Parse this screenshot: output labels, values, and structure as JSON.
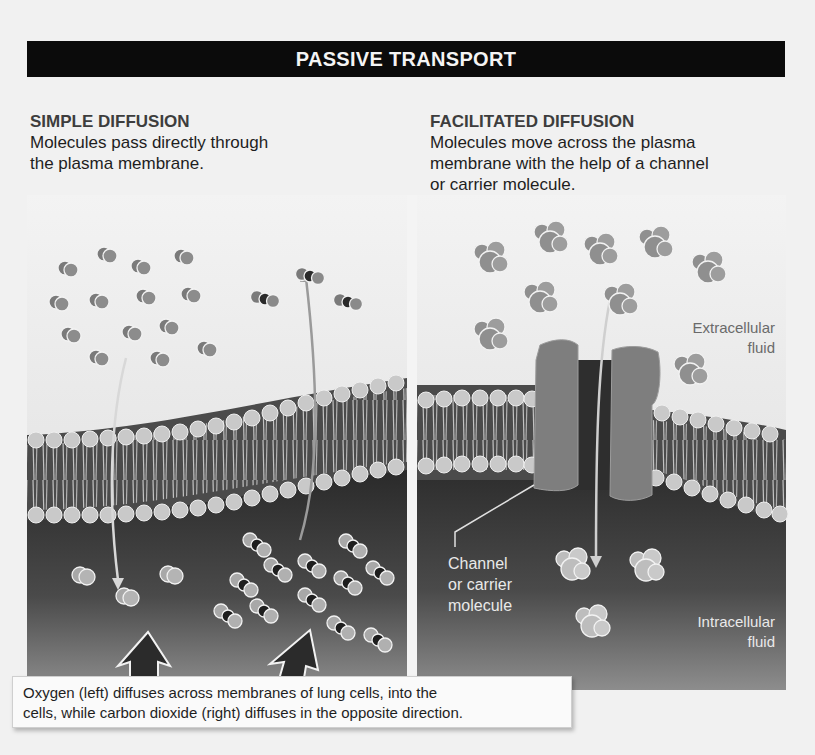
{
  "title": "PASSIVE TRANSPORT",
  "panels": {
    "simple": {
      "heading": "SIMPLE DIFFUSION",
      "description": "Molecules pass directly through the plasma membrane.",
      "description_lines": [
        "Molecules pass directly through",
        "the plasma membrane."
      ]
    },
    "facilitated": {
      "heading": "FACILITATED DIFFUSION",
      "description": "Molecules move across the plasma membrane with the help of a channel or carrier molecule.",
      "description_lines": [
        "Molecules move across the plasma",
        "membrane with the help of a channel",
        "or carrier molecule."
      ],
      "labels": {
        "extracellular_1": "Extracellular",
        "extracellular_2": "fluid",
        "channel_1": "Channel",
        "channel_2": "or carrier",
        "channel_3": "molecule",
        "intracellular_1": "Intracellular",
        "intracellular_2": "fluid"
      }
    }
  },
  "caption": {
    "line1": "Oxygen (left) diffuses across membranes of lung cells, into the",
    "line2": "cells, while carbon dioxide (right) diffuses in the opposite direction."
  },
  "colors": {
    "title_bg": "#0b0b0b",
    "extracellular_light": "#e8e8e8",
    "intracellular_dark": "#3a3a3a",
    "molecule_gray": "#8a8a8a",
    "channel_gray": "#7e7e7e"
  },
  "molecules": {
    "oxygen_outside": [
      [
        65,
        268
      ],
      [
        104,
        254
      ],
      [
        138,
        266
      ],
      [
        181,
        256
      ],
      [
        56,
        302
      ],
      [
        96,
        300
      ],
      [
        143,
        296
      ],
      [
        188,
        294
      ],
      [
        68,
        334
      ],
      [
        129,
        332
      ],
      [
        166,
        326
      ],
      [
        204,
        348
      ],
      [
        96,
        357
      ],
      [
        157,
        358
      ]
    ],
    "oxygen_inside": [
      [
        80,
        575
      ],
      [
        124,
        596
      ],
      [
        168,
        574
      ]
    ],
    "co2_outside": [
      [
        265,
        299
      ],
      [
        310,
        276
      ],
      [
        348,
        302
      ]
    ],
    "co2_inside": [
      [
        257,
        545
      ],
      [
        353,
        546
      ],
      [
        244,
        585
      ],
      [
        278,
        570
      ],
      [
        312,
        566
      ],
      [
        348,
        583
      ],
      [
        380,
        573
      ],
      [
        228,
        616
      ],
      [
        264,
        611
      ],
      [
        312,
        600
      ],
      [
        341,
        628
      ],
      [
        378,
        640
      ]
    ],
    "solute_outside": [
      [
        490,
        258
      ],
      [
        550,
        238
      ],
      [
        600,
        250
      ],
      [
        655,
        243
      ],
      [
        708,
        268
      ],
      [
        540,
        298
      ],
      [
        620,
        300
      ],
      [
        490,
        335
      ],
      [
        690,
        370
      ]
    ],
    "solute_inside": [
      [
        572,
        565
      ],
      [
        646,
        566
      ],
      [
        592,
        622
      ]
    ]
  }
}
